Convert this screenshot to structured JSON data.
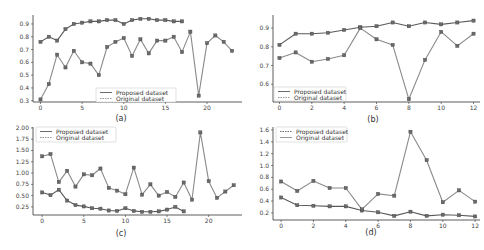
{
  "chart_data": [
    {
      "id": "a",
      "type": "line",
      "caption": "(a)",
      "title": "",
      "xlabel": "",
      "ylabel": "",
      "xticks": [
        0,
        5,
        10,
        15,
        20
      ],
      "yticks": [
        0.3,
        0.4,
        0.5,
        0.6,
        0.7,
        0.8,
        0.9
      ],
      "ytick_labels": [
        "0.3",
        "0.4",
        "0.5",
        "0.6",
        "0.7",
        "0.8",
        "0.9"
      ],
      "xlim": [
        -0.9,
        24.2
      ],
      "ylim": [
        0.29,
        0.97
      ],
      "grid": false,
      "legend_position": "lower center",
      "series": [
        {
          "name": "Proposed dataset",
          "style": "solid",
          "color": "#5a5a5a",
          "x": [
            0,
            1,
            2,
            3,
            4,
            5,
            6,
            7,
            8,
            9,
            10,
            11,
            12,
            13,
            14,
            15,
            16,
            17
          ],
          "values": [
            0.76,
            0.8,
            0.77,
            0.86,
            0.9,
            0.91,
            0.92,
            0.92,
            0.93,
            0.93,
            0.9,
            0.93,
            0.94,
            0.94,
            0.93,
            0.93,
            0.92,
            0.92
          ]
        },
        {
          "name": "Original dataset",
          "style": "dotted",
          "color": "#8a8a8a",
          "x": [
            0,
            1,
            2,
            3,
            4,
            5,
            6,
            7,
            8,
            9,
            10,
            11,
            12,
            13,
            14,
            15,
            16,
            17,
            18,
            19,
            20,
            21,
            22,
            23
          ],
          "values": [
            0.31,
            0.43,
            0.66,
            0.56,
            0.69,
            0.6,
            0.59,
            0.5,
            0.72,
            0.76,
            0.79,
            0.65,
            0.78,
            0.67,
            0.77,
            0.77,
            0.8,
            0.68,
            0.84,
            0.34,
            0.75,
            0.81,
            0.76,
            0.69
          ]
        }
      ]
    },
    {
      "id": "b",
      "type": "line",
      "caption": "(b)",
      "title": "",
      "xlabel": "",
      "ylabel": "",
      "xticks": [
        0,
        2,
        4,
        6,
        8,
        10,
        12
      ],
      "yticks": [
        0.6,
        0.7,
        0.8,
        0.9
      ],
      "ytick_labels": [
        "0.6",
        "0.7",
        "0.8",
        "0.9"
      ],
      "xlim": [
        -0.4,
        12.4
      ],
      "ylim": [
        0.505,
        0.97
      ],
      "grid": false,
      "legend_position": "lower left",
      "series": [
        {
          "name": "Proposed dataset",
          "style": "solid",
          "color": "#5a5a5a",
          "x": [
            0,
            1,
            2,
            3,
            4,
            5,
            6,
            7,
            8,
            9,
            10,
            11,
            12
          ],
          "values": [
            0.81,
            0.87,
            0.87,
            0.875,
            0.89,
            0.905,
            0.91,
            0.93,
            0.91,
            0.93,
            0.92,
            0.93,
            0.94
          ]
        },
        {
          "name": "Original dataset",
          "style": "dotted",
          "color": "#8a8a8a",
          "x": [
            0,
            1,
            2,
            3,
            4,
            5,
            6,
            7,
            8,
            9,
            10,
            11,
            12
          ],
          "values": [
            0.74,
            0.77,
            0.72,
            0.735,
            0.755,
            0.9,
            0.84,
            0.81,
            0.52,
            0.73,
            0.88,
            0.805,
            0.87
          ]
        }
      ]
    },
    {
      "id": "c",
      "type": "line",
      "caption": "(c)",
      "title": "",
      "xlabel": "",
      "ylabel": "",
      "xticks": [
        0,
        5,
        10,
        15,
        20
      ],
      "yticks": [
        0.25,
        0.5,
        0.75,
        1.0,
        1.25,
        1.5,
        1.75,
        2.0
      ],
      "ytick_labels": [
        "0.25",
        "0.50",
        "0.75",
        "1.00",
        "1.25",
        "1.50",
        "1.75",
        "2.00"
      ],
      "xlim": [
        -1.1,
        24.0
      ],
      "ylim": [
        0.07,
        2.02
      ],
      "grid": false,
      "legend_position": "upper left",
      "series": [
        {
          "name": "Proposed dataset",
          "style": "solid",
          "color": "#5a5a5a",
          "x": [
            0,
            1,
            2,
            3,
            4,
            5,
            6,
            7,
            8,
            9,
            10,
            11,
            12,
            13,
            14,
            15,
            16,
            17
          ],
          "values": [
            0.57,
            0.51,
            0.63,
            0.39,
            0.29,
            0.26,
            0.22,
            0.21,
            0.17,
            0.16,
            0.22,
            0.16,
            0.14,
            0.14,
            0.15,
            0.19,
            0.25,
            0.15
          ]
        },
        {
          "name": "Original dataset",
          "style": "dotted",
          "color": "#8a8a8a",
          "x": [
            0,
            1,
            2,
            3,
            4,
            5,
            6,
            7,
            8,
            9,
            10,
            11,
            12,
            13,
            14,
            15,
            16,
            17,
            18,
            19,
            20,
            21,
            22,
            23
          ],
          "values": [
            1.37,
            1.42,
            0.8,
            1.05,
            0.7,
            0.97,
            0.95,
            1.1,
            0.67,
            0.61,
            0.53,
            1.12,
            0.52,
            0.75,
            0.5,
            0.58,
            0.47,
            0.79,
            0.41,
            1.9,
            0.82,
            0.45,
            0.59,
            0.73
          ]
        }
      ]
    },
    {
      "id": "d",
      "type": "line",
      "caption": "(d)",
      "title": "",
      "xlabel": "",
      "ylabel": "",
      "xticks": [
        0,
        2,
        4,
        6,
        8,
        10,
        12
      ],
      "yticks": [
        0.2,
        0.4,
        0.6,
        0.8,
        1.0,
        1.2,
        1.4,
        1.6
      ],
      "ytick_labels": [
        "0.2",
        "0.4",
        "0.6",
        "0.8",
        "1.0",
        "1.2",
        "1.4",
        "1.6"
      ],
      "xlim": [
        -0.5,
        12.3
      ],
      "ylim": [
        0.08,
        1.65
      ],
      "grid": false,
      "legend_position": "upper left",
      "series": [
        {
          "name": "Proposed dataset",
          "style": "dotted",
          "color": "#5a5a5a",
          "x": [
            0,
            1,
            2,
            3,
            4,
            5,
            6,
            7,
            8,
            9,
            10,
            11,
            12
          ],
          "values": [
            0.46,
            0.33,
            0.32,
            0.31,
            0.31,
            0.24,
            0.21,
            0.15,
            0.22,
            0.15,
            0.17,
            0.16,
            0.14
          ]
        },
        {
          "name": "Original dataset",
          "style": "solid",
          "color": "#8a8a8a",
          "x": [
            0,
            1,
            2,
            3,
            4,
            5,
            6,
            7,
            8,
            9,
            10,
            11,
            12
          ],
          "values": [
            0.73,
            0.57,
            0.74,
            0.62,
            0.62,
            0.26,
            0.52,
            0.49,
            1.57,
            1.09,
            0.38,
            0.58,
            0.39
          ]
        }
      ]
    }
  ],
  "layout": {
    "panels": {
      "a": {
        "x0": 33,
        "x1": 242,
        "y0": 15,
        "y1": 102,
        "legend": {
          "x": 96,
          "y": 88,
          "w": 80,
          "h": 14
        },
        "caption_x": 121,
        "caption_y": 121
      },
      "b": {
        "x0": 273,
        "x1": 480,
        "y0": 15,
        "y1": 102,
        "legend": {
          "x": 274,
          "y": 87,
          "w": 72,
          "h": 14
        },
        "caption_x": 373,
        "caption_y": 122
      },
      "c": {
        "x0": 33,
        "x1": 242,
        "y0": 127,
        "y1": 215,
        "legend": {
          "x": 36,
          "y": 127,
          "w": 80,
          "h": 15
        },
        "caption_x": 121,
        "caption_y": 236
      },
      "d": {
        "x0": 273,
        "x1": 480,
        "y0": 127,
        "y1": 220,
        "legend": {
          "x": 276,
          "y": 127,
          "w": 71,
          "h": 15
        },
        "caption_x": 371,
        "caption_y": 235
      }
    }
  }
}
